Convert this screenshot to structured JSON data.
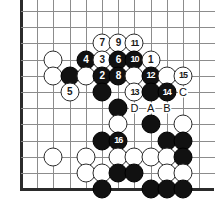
{
  "diagram": {
    "type": "go-board-problem-diagram",
    "board": {
      "grid_spacing_px": 16.2,
      "origin_x_px": 21,
      "origin_y_px": 11,
      "columns": 13,
      "rows": 12,
      "left_edge": true,
      "top_edge": false,
      "bottom_edge": true,
      "right_edge": false,
      "line_color": "#8c8c8c",
      "edge_color": "#2b2b2b",
      "background_color": "#ffffff"
    },
    "star_points": [
      {
        "col": 2,
        "row": 3
      },
      {
        "col": 2,
        "row": 9
      }
    ],
    "colors": {
      "black_stone": "#111111",
      "white_stone": "#ffffff",
      "black_label": "#ffffff",
      "white_label": "#1a1a1a",
      "letter_marker": "#111111"
    },
    "stones": [
      {
        "col": 2,
        "row": 3,
        "color": "white",
        "label": ""
      },
      {
        "col": 2,
        "row": 4,
        "color": "white",
        "label": ""
      },
      {
        "col": 3,
        "row": 4,
        "color": "black",
        "label": ""
      },
      {
        "col": 3,
        "row": 5,
        "color": "white",
        "label": "5"
      },
      {
        "col": 5,
        "row": 2,
        "color": "white",
        "label": "7"
      },
      {
        "col": 6,
        "row": 2,
        "color": "white",
        "label": "9"
      },
      {
        "col": 7,
        "row": 2,
        "color": "white",
        "label": "11"
      },
      {
        "col": 4,
        "row": 3,
        "color": "black",
        "label": "4"
      },
      {
        "col": 5,
        "row": 3,
        "color": "white",
        "label": "3"
      },
      {
        "col": 6,
        "row": 3,
        "color": "black",
        "label": "6"
      },
      {
        "col": 7,
        "row": 3,
        "color": "black",
        "label": "10"
      },
      {
        "col": 8,
        "row": 3,
        "color": "white",
        "label": "1"
      },
      {
        "col": 4,
        "row": 4,
        "color": "white",
        "label": ""
      },
      {
        "col": 5,
        "row": 4,
        "color": "black",
        "label": "2"
      },
      {
        "col": 6,
        "row": 4,
        "color": "black",
        "label": "8"
      },
      {
        "col": 7,
        "row": 4,
        "color": "white",
        "label": ""
      },
      {
        "col": 8,
        "row": 4,
        "color": "black",
        "label": "12"
      },
      {
        "col": 9,
        "row": 4,
        "color": "white",
        "label": ""
      },
      {
        "col": 10,
        "row": 4,
        "color": "white",
        "label": "15"
      },
      {
        "col": 5,
        "row": 5,
        "color": "black",
        "label": ""
      },
      {
        "col": 7,
        "row": 5,
        "color": "white",
        "label": "13"
      },
      {
        "col": 8,
        "row": 5,
        "color": "black",
        "label": ""
      },
      {
        "col": 9,
        "row": 5,
        "color": "black",
        "label": "14"
      },
      {
        "col": 6,
        "row": 6,
        "color": "black",
        "label": ""
      },
      {
        "col": 6,
        "row": 7,
        "color": "white",
        "label": ""
      },
      {
        "col": 8,
        "row": 7,
        "color": "black",
        "label": ""
      },
      {
        "col": 10,
        "row": 7,
        "color": "white",
        "label": ""
      },
      {
        "col": 5,
        "row": 8,
        "color": "black",
        "label": ""
      },
      {
        "col": 6,
        "row": 8,
        "color": "black",
        "label": "16"
      },
      {
        "col": 9,
        "row": 8,
        "color": "black",
        "label": ""
      },
      {
        "col": 10,
        "row": 8,
        "color": "black",
        "label": ""
      },
      {
        "col": 2,
        "row": 9,
        "color": "white",
        "label": ""
      },
      {
        "col": 4,
        "row": 9,
        "color": "white",
        "label": ""
      },
      {
        "col": 6,
        "row": 9,
        "color": "white",
        "label": ""
      },
      {
        "col": 7,
        "row": 9,
        "color": "white",
        "label": ""
      },
      {
        "col": 8,
        "row": 9,
        "color": "white",
        "label": ""
      },
      {
        "col": 9,
        "row": 9,
        "color": "white",
        "label": ""
      },
      {
        "col": 10,
        "row": 9,
        "color": "black",
        "label": ""
      },
      {
        "col": 4,
        "row": 10,
        "color": "white",
        "label": ""
      },
      {
        "col": 5,
        "row": 10,
        "color": "white",
        "label": ""
      },
      {
        "col": 6,
        "row": 10,
        "color": "black",
        "label": ""
      },
      {
        "col": 7,
        "row": 10,
        "color": "black",
        "label": ""
      },
      {
        "col": 9,
        "row": 10,
        "color": "white",
        "label": ""
      },
      {
        "col": 10,
        "row": 10,
        "color": "white",
        "label": ""
      },
      {
        "col": 5,
        "row": 11,
        "color": "black",
        "label": ""
      },
      {
        "col": 8,
        "row": 11,
        "color": "black",
        "label": ""
      },
      {
        "col": 9,
        "row": 11,
        "color": "black",
        "label": ""
      },
      {
        "col": 10,
        "row": 11,
        "color": "black",
        "label": ""
      }
    ],
    "letter_markers": [
      {
        "col": 10,
        "row": 5,
        "text": "C"
      },
      {
        "col": 7,
        "row": 6,
        "text": "D"
      },
      {
        "col": 8,
        "row": 6,
        "text": "A"
      },
      {
        "col": 9,
        "row": 6,
        "text": "B"
      }
    ]
  }
}
